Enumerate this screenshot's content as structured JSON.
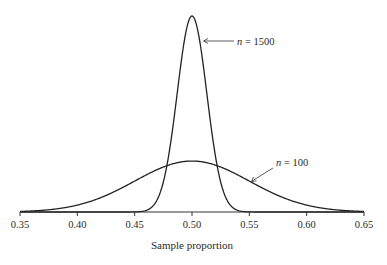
{
  "chart_data": {
    "type": "line",
    "title": "",
    "xlabel": "Sample proportion",
    "ylabel": "",
    "xlim": [
      0.35,
      0.65
    ],
    "x_ticks": [
      0.35,
      0.4,
      0.45,
      0.5,
      0.55,
      0.6,
      0.65
    ],
    "x_tick_labels": [
      "0.35",
      "0.40",
      "0.45",
      "0.50",
      "0.55",
      "0.60",
      "0.65"
    ],
    "y_axis_shown": false,
    "grid": false,
    "legend": "none (curves labeled by annotations)",
    "series": [
      {
        "name": "n = 1500",
        "distribution": "normal",
        "mean": 0.5,
        "sd": 0.0129,
        "relative_peak_height": 1.0
      },
      {
        "name": "n = 100",
        "distribution": "normal",
        "mean": 0.5,
        "sd": 0.05,
        "relative_peak_height": 0.26
      }
    ],
    "annotations": [
      {
        "series": "n = 1500",
        "label_var": "n",
        "label_value": "1500",
        "arrow_points_to": "right flank of tall narrow curve"
      },
      {
        "series": "n = 100",
        "label_var": "n",
        "label_value": "100",
        "arrow_points_to": "right flank of wide flat curve"
      }
    ]
  },
  "labels": {
    "xlabel": "Sample proportion",
    "annot_1500_var": "n",
    "annot_1500_eq": " = 1500",
    "annot_100_var": "n",
    "annot_100_eq": " = 100"
  },
  "ticks": [
    "0.35",
    "0.40",
    "0.45",
    "0.50",
    "0.55",
    "0.60",
    "0.65"
  ]
}
